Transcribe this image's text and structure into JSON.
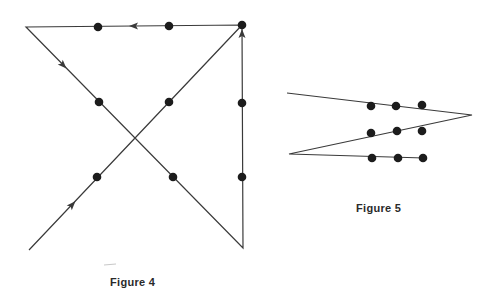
{
  "figures": [
    {
      "id": "figure-4",
      "caption": "Figure 4",
      "description": "3x3 dot puzzle solved with four connected straight lines (path extends beyond the grid)",
      "dots": [
        {
          "x": 98,
          "y": 27
        },
        {
          "x": 169,
          "y": 26
        },
        {
          "x": 242,
          "y": 25
        },
        {
          "x": 99,
          "y": 102
        },
        {
          "x": 169,
          "y": 102
        },
        {
          "x": 242,
          "y": 103
        },
        {
          "x": 97,
          "y": 177
        },
        {
          "x": 173,
          "y": 177
        },
        {
          "x": 242,
          "y": 177
        }
      ],
      "path": [
        {
          "x": 29,
          "y": 250
        },
        {
          "x": 242,
          "y": 25
        },
        {
          "x": 26,
          "y": 27
        },
        {
          "x": 243,
          "y": 248
        },
        {
          "x": 242,
          "y": 25
        }
      ],
      "arrows": [
        {
          "x": 72,
          "y": 205,
          "angle": -46.6
        },
        {
          "x": 134,
          "y": 26,
          "angle": 180
        },
        {
          "x": 63,
          "y": 65,
          "angle": 45.7
        },
        {
          "x": 242,
          "y": 34,
          "angle": -90
        }
      ]
    },
    {
      "id": "figure-5",
      "caption": "Figure 5",
      "description": "3x3 dot puzzle solved with three connected straight lines",
      "dots": [
        {
          "x": 371,
          "y": 106
        },
        {
          "x": 396,
          "y": 106
        },
        {
          "x": 422,
          "y": 105
        },
        {
          "x": 371,
          "y": 133
        },
        {
          "x": 397,
          "y": 131
        },
        {
          "x": 422,
          "y": 131
        },
        {
          "x": 372,
          "y": 158
        },
        {
          "x": 398,
          "y": 158
        },
        {
          "x": 423,
          "y": 158
        }
      ],
      "path": [
        {
          "x": 287,
          "y": 93
        },
        {
          "x": 472,
          "y": 115
        },
        {
          "x": 289,
          "y": 154
        },
        {
          "x": 424,
          "y": 158
        }
      ],
      "arrows": []
    }
  ],
  "style": {
    "line_color": "#3a3a3a",
    "dot_color": "#1c1c1c",
    "background": "#ffffff"
  }
}
